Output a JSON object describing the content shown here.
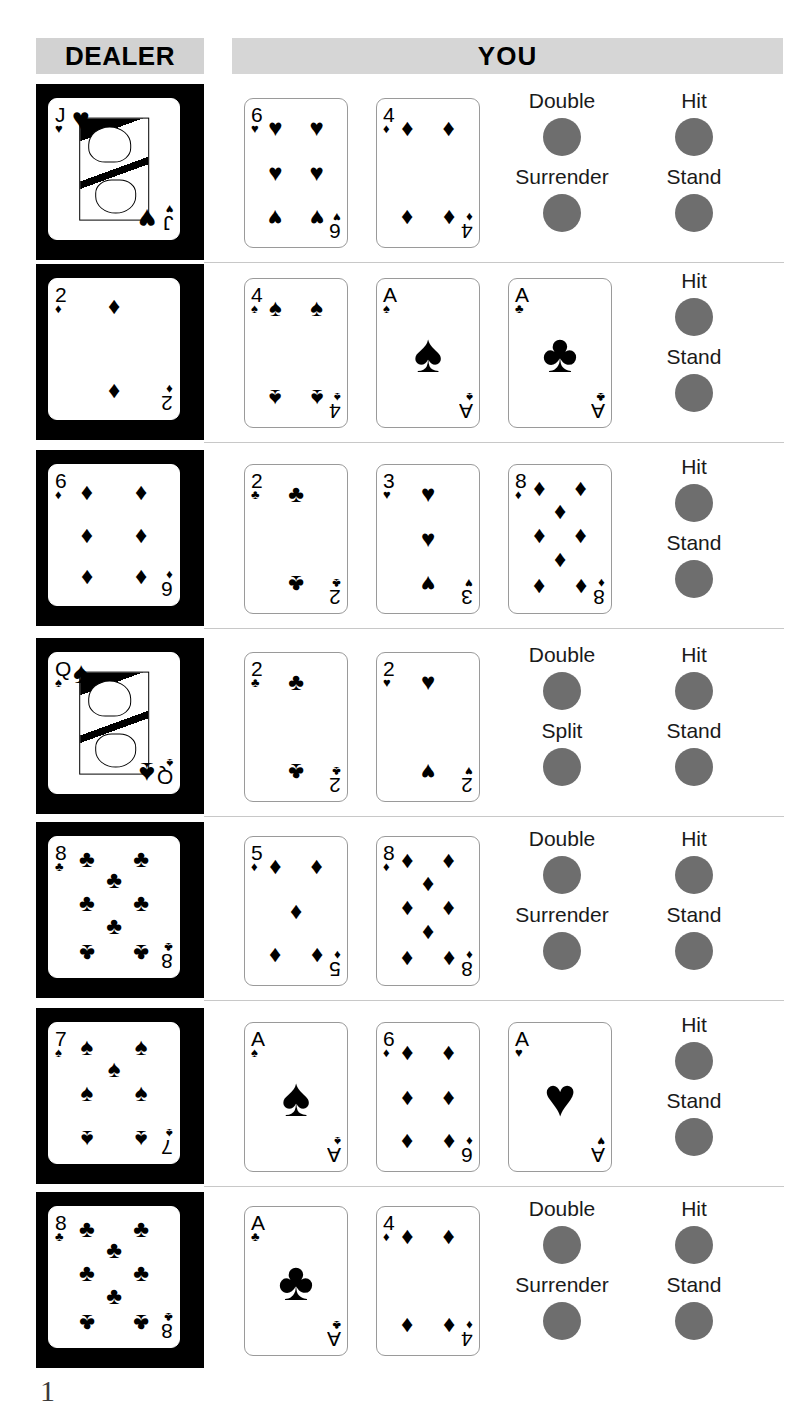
{
  "header": {
    "dealer_label": "DEALER",
    "you_label": "YOU"
  },
  "colors": {
    "band": "#d4d4d4",
    "dealer_block": "#000000",
    "bubble": "#6e6e6e",
    "separator": "#c8c8c8"
  },
  "suits": {
    "hearts": "♥",
    "diamonds": "♦",
    "spades": "♠",
    "clubs": "♣"
  },
  "chart_data": {
    "type": "table",
    "columns": [
      "Dealer Upcard",
      "Your Cards",
      "Available Actions"
    ],
    "rows": [
      {
        "dealer": {
          "rank": "J",
          "suit": "hearts",
          "face": true
        },
        "player": [
          {
            "rank": "6",
            "suit": "hearts",
            "count": 6
          },
          {
            "rank": "4",
            "suit": "diamonds",
            "count": 4
          }
        ],
        "actions": [
          "Double",
          "Hit",
          "Surrender",
          "Stand"
        ]
      },
      {
        "dealer": {
          "rank": "2",
          "suit": "diamonds",
          "face": false,
          "count": 2
        },
        "player": [
          {
            "rank": "4",
            "suit": "spades",
            "count": 4
          },
          {
            "rank": "A",
            "suit": "spades",
            "count": 1
          },
          {
            "rank": "A",
            "suit": "clubs",
            "count": 1
          }
        ],
        "actions": [
          "Hit",
          "Stand"
        ]
      },
      {
        "dealer": {
          "rank": "6",
          "suit": "diamonds",
          "face": false,
          "count": 6
        },
        "player": [
          {
            "rank": "2",
            "suit": "clubs",
            "count": 2
          },
          {
            "rank": "3",
            "suit": "hearts",
            "count": 3
          },
          {
            "rank": "8",
            "suit": "diamonds",
            "count": 8
          }
        ],
        "actions": [
          "Hit",
          "Stand"
        ]
      },
      {
        "dealer": {
          "rank": "Q",
          "suit": "spades",
          "face": true
        },
        "player": [
          {
            "rank": "2",
            "suit": "clubs",
            "count": 2
          },
          {
            "rank": "2",
            "suit": "hearts",
            "count": 2
          }
        ],
        "actions": [
          "Double",
          "Hit",
          "Split",
          "Stand"
        ]
      },
      {
        "dealer": {
          "rank": "8",
          "suit": "clubs",
          "face": false,
          "count": 8
        },
        "player": [
          {
            "rank": "5",
            "suit": "diamonds",
            "count": 5
          },
          {
            "rank": "8",
            "suit": "diamonds",
            "count": 8
          }
        ],
        "actions": [
          "Double",
          "Hit",
          "Surrender",
          "Stand"
        ]
      },
      {
        "dealer": {
          "rank": "7",
          "suit": "spades",
          "face": false,
          "count": 7
        },
        "player": [
          {
            "rank": "A",
            "suit": "spades",
            "count": 1
          },
          {
            "rank": "6",
            "suit": "diamonds",
            "count": 6
          },
          {
            "rank": "A",
            "suit": "hearts",
            "count": 1
          }
        ],
        "actions": [
          "Hit",
          "Stand"
        ]
      },
      {
        "dealer": {
          "rank": "8",
          "suit": "clubs",
          "face": false,
          "count": 8
        },
        "player": [
          {
            "rank": "A",
            "suit": "clubs",
            "count": 1
          },
          {
            "rank": "4",
            "suit": "diamonds",
            "count": 4
          }
        ],
        "actions": [
          "Double",
          "Hit",
          "Surrender",
          "Stand"
        ]
      }
    ]
  },
  "footer": {
    "page_mark": "1"
  }
}
